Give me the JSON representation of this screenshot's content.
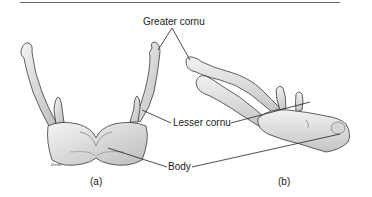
{
  "figure": {
    "labels": {
      "greater_cornu": "Greater cornu",
      "lesser_cornu": "Lesser cornu",
      "body": "Body"
    },
    "captions": {
      "a": "(a)",
      "b": "(b)"
    },
    "signature": "Denk",
    "colors": {
      "bone_fill": "#ececec",
      "bone_shade": "#b8b8b8",
      "outline": "#3a3a3a",
      "leader_line": "#222222",
      "rule": "#6a6a6a"
    }
  }
}
